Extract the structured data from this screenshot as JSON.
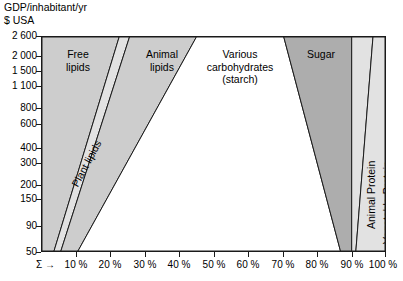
{
  "chart_data": {
    "type": "area",
    "title": "",
    "ylabel_line1": "GDP/inhabitant/yr",
    "ylabel_line2": "$ USA",
    "xlabel": "",
    "sigma_marker": "Σ →",
    "grid": false,
    "legend_position": "inside-regions",
    "yscale": "log",
    "ylim": [
      50,
      2600
    ],
    "xlim": [
      0,
      100
    ],
    "ytick_labels": [
      "2 600",
      "2 000",
      "1 500",
      "1 100",
      "800",
      "600",
      "400",
      "300",
      "200",
      "150",
      "90",
      "50"
    ],
    "ytick_values": [
      2600,
      2000,
      1500,
      1100,
      800,
      600,
      400,
      300,
      200,
      150,
      90,
      50
    ],
    "xtick_labels": [
      "10 %",
      "20 %",
      "30 %",
      "40 %",
      "50 %",
      "60 %",
      "70 %",
      "80 %",
      "90 %",
      "100 %"
    ],
    "xtick_values": [
      10,
      20,
      30,
      40,
      50,
      60,
      70,
      80,
      90,
      100
    ],
    "series": [
      {
        "name": "Free lipids",
        "label": "Free\nlipids",
        "color": "#cdcdcd",
        "values_at_50": [
          0,
          3.5
        ],
        "values_at_2600": [
          0,
          22.5
        ]
      },
      {
        "name": "Plant lipids",
        "label": "Plant lipids",
        "color": "#e2e2e2",
        "values_at_50": [
          3.5,
          5.5
        ],
        "values_at_2600": [
          22.5,
          25.5
        ]
      },
      {
        "name": "Animal lipids",
        "label": "Animal\nlipids",
        "color": "#cdcdcd",
        "values_at_50": [
          5.5,
          10.5
        ],
        "values_at_2600": [
          25.5,
          45.0
        ]
      },
      {
        "name": "Various carbohydrates (starch)",
        "label": "Various\ncarbohydrates\n(starch)",
        "color": "#ffffff",
        "values_at_50": [
          10.5,
          87.0
        ],
        "values_at_2600": [
          45.0,
          70.5
        ]
      },
      {
        "name": "Sugar",
        "label": "Sugar",
        "color": "#adadad",
        "values_at_50": [
          87.0,
          90.3
        ],
        "values_at_2600": [
          70.5,
          90.3
        ]
      },
      {
        "name": "Animal Protein",
        "label": "Animal Protein",
        "color": "#e2e2e2",
        "values_at_50": [
          90.3,
          91.5
        ],
        "values_at_2600": [
          90.3,
          96.5
        ]
      },
      {
        "name": "Vegetable Protein",
        "label": "Vegetable Protein",
        "color": "#e2e2e2",
        "values_at_50": [
          91.5,
          100
        ],
        "values_at_2600": [
          96.5,
          100
        ]
      }
    ]
  },
  "labels": {
    "free_lipids": "Free\nlipids",
    "plant_lipids": "Plant lipids",
    "animal_lipids": "Animal\nlipids",
    "carbohydrates": "Various\ncarbohydrates\n(starch)",
    "sugar": "Sugar",
    "animal_protein": "Animal Protein",
    "vegetable_protein": "Vegetable Protein"
  },
  "colors": {
    "band_dark": "#cdcdcd",
    "band_light": "#e2e2e2",
    "band_sugar": "#adadad",
    "band_white": "#ffffff",
    "line": "#1a1a1a",
    "text": "#000000"
  }
}
